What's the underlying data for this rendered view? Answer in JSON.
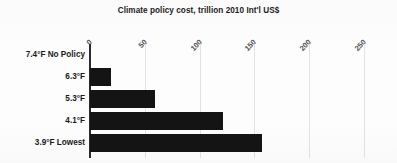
{
  "chart_data": {
    "type": "bar",
    "orientation": "horizontal",
    "title": "Climate policy cost, trillion 2010 Int'l US$",
    "xlabel": "",
    "ylabel": "",
    "categories": [
      "7.4°F No Policy",
      "6.3°F",
      "5.3°F",
      "4.1°F",
      "3.9°F Lowest"
    ],
    "values": [
      0,
      19,
      59,
      121,
      157
    ],
    "xlim": [
      0,
      250
    ],
    "xticks": [
      0,
      50,
      100,
      150,
      200,
      250
    ],
    "xtick_labels": [
      "0",
      "50",
      "100",
      "150",
      "200",
      "250"
    ],
    "xtick_rotation": 45,
    "grid": "vertical-only",
    "legend": "none",
    "bar_color": "#141414",
    "axis_color": "#2b2b2b",
    "gridline_color": "#e2e2e2",
    "background_color": "#fdfdfd",
    "series": [
      {
        "name": "Climate policy cost",
        "values": [
          0,
          19,
          59,
          121,
          157
        ]
      }
    ]
  }
}
